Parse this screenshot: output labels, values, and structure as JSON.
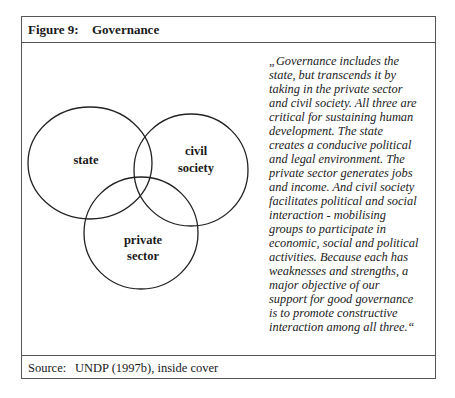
{
  "figure": {
    "label": "Figure 9:",
    "title": "Governance"
  },
  "venn": {
    "circles": [
      {
        "id": "state",
        "lines": [
          "state"
        ]
      },
      {
        "id": "civil-society",
        "lines": [
          "civil",
          "society"
        ]
      },
      {
        "id": "private-sector",
        "lines": [
          "private",
          "sector"
        ]
      }
    ],
    "stroke_color": "#222222"
  },
  "quote": {
    "text": "„Governance includes the\nstate, but transcends it by\ntaking in the private sector\nand civil society. All three are\ncritical for sustaining human\ndevelopment. The state\ncreates a conducive political\nand legal environment. The\nprivate sector generates jobs\nand income. And civil society\nfacilitates political and social\ninteraction - mobilising\ngroups to participate in\neconomic, social and political\nactivities. Because each has\nweaknesses and strengths, a\nmajor objective of our\nsupport for good governance\nis to promote constructive\ninteraction among all three.“"
  },
  "source": {
    "label": "Source:",
    "text": "UNDP (1997b), inside cover"
  }
}
